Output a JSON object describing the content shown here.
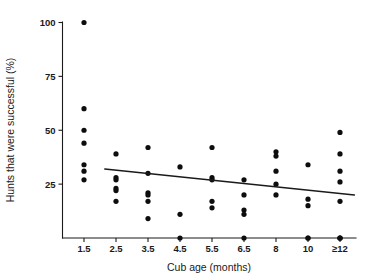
{
  "chart_data": {
    "type": "scatter",
    "title": "",
    "xlabel": "Cub age (months)",
    "ylabel": "Hunts that were successful (%)",
    "categories": [
      "1.5",
      "2.5",
      "3.5",
      "4.5",
      "5.5",
      "6.5",
      "8",
      "10",
      "≥12"
    ],
    "xtick_labels": [
      "1.5",
      "2.5",
      "3.5",
      "4.5",
      "5.5",
      "6.5",
      "8",
      "10",
      "≥12"
    ],
    "ytick_labels": [
      "25",
      "50",
      "75",
      "100"
    ],
    "yticks": [
      25,
      50,
      75,
      100
    ],
    "ylim": [
      0,
      105
    ],
    "grid": false,
    "legend": false,
    "marker": "filled-circle",
    "marker_color": "#0d0d0d",
    "axis_color": "#1a1a1a",
    "background_color": "#ffffff",
    "points": [
      {
        "category": "1.5",
        "value": 100
      },
      {
        "category": "1.5",
        "value": 60
      },
      {
        "category": "1.5",
        "value": 50
      },
      {
        "category": "1.5",
        "value": 44
      },
      {
        "category": "1.5",
        "value": 34
      },
      {
        "category": "1.5",
        "value": 31
      },
      {
        "category": "1.5",
        "value": 27
      },
      {
        "category": "2.5",
        "value": 39
      },
      {
        "category": "2.5",
        "value": 28
      },
      {
        "category": "2.5",
        "value": 27
      },
      {
        "category": "2.5",
        "value": 23
      },
      {
        "category": "2.5",
        "value": 22
      },
      {
        "category": "2.5",
        "value": 17
      },
      {
        "category": "3.5",
        "value": 42
      },
      {
        "category": "3.5",
        "value": 30
      },
      {
        "category": "3.5",
        "value": 21
      },
      {
        "category": "3.5",
        "value": 20
      },
      {
        "category": "3.5",
        "value": 17
      },
      {
        "category": "3.5",
        "value": 9
      },
      {
        "category": "4.5",
        "value": 33
      },
      {
        "category": "4.5",
        "value": 11
      },
      {
        "category": "4.5",
        "value": 0
      },
      {
        "category": "5.5",
        "value": 42
      },
      {
        "category": "5.5",
        "value": 28
      },
      {
        "category": "5.5",
        "value": 27
      },
      {
        "category": "5.5",
        "value": 17
      },
      {
        "category": "5.5",
        "value": 14
      },
      {
        "category": "6.5",
        "value": 27
      },
      {
        "category": "6.5",
        "value": 20
      },
      {
        "category": "6.5",
        "value": 13
      },
      {
        "category": "6.5",
        "value": 11
      },
      {
        "category": "6.5",
        "value": 0
      },
      {
        "category": "8",
        "value": 40
      },
      {
        "category": "8",
        "value": 38
      },
      {
        "category": "8",
        "value": 31
      },
      {
        "category": "8",
        "value": 25
      },
      {
        "category": "8",
        "value": 20
      },
      {
        "category": "10",
        "value": 34
      },
      {
        "category": "10",
        "value": 18
      },
      {
        "category": "10",
        "value": 15
      },
      {
        "category": "10",
        "value": 0
      },
      {
        "category": "10",
        "value": 0
      },
      {
        "category": "≥12",
        "value": 49
      },
      {
        "category": "≥12",
        "value": 39
      },
      {
        "category": "≥12",
        "value": 31
      },
      {
        "category": "≥12",
        "value": 26
      },
      {
        "category": "≥12",
        "value": 17
      },
      {
        "category": "≥12",
        "value": 0
      },
      {
        "category": "≥12",
        "value": 0
      },
      {
        "category": "≥12",
        "value": 0
      }
    ],
    "trend_line": {
      "description": "linear regression fit",
      "x_start_category_index": 0.65,
      "x_end_category_index": 8.45,
      "y_start": 32,
      "y_end": 20
    }
  }
}
